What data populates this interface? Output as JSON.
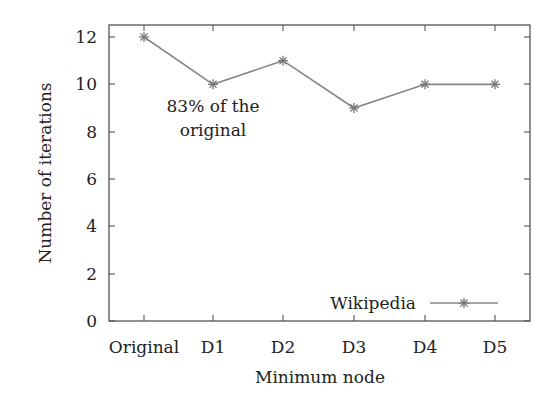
{
  "chart_data": {
    "type": "line",
    "title": "",
    "xlabel": "Minimum node",
    "ylabel": "Number of iterations",
    "categories": [
      "Original",
      "D1",
      "D2",
      "D3",
      "D4",
      "D5"
    ],
    "series": [
      {
        "name": "Wikipedia",
        "values": [
          12,
          10,
          11,
          9,
          10,
          10
        ],
        "color": "#888888",
        "marker": "asterisk"
      }
    ],
    "ylim": [
      0,
      12.5
    ],
    "yticks": [
      0,
      2,
      4,
      6,
      8,
      10,
      12
    ],
    "grid": false,
    "legend_position": "lower right",
    "annotations": [
      {
        "text_line1": "83% of the",
        "text_line2": "original",
        "anchor_category": "D1"
      }
    ]
  },
  "axes": {
    "x_title": "Minimum node",
    "y_title": "Number of iterations",
    "y_tick_labels": [
      "0",
      "2",
      "4",
      "6",
      "8",
      "10",
      "12"
    ],
    "x_tick_labels": [
      "Original",
      "D1",
      "D2",
      "D3",
      "D4",
      "D5"
    ]
  },
  "annotation": {
    "line1": "83% of the",
    "line2": "original"
  },
  "legend": {
    "label": "Wikipedia"
  }
}
